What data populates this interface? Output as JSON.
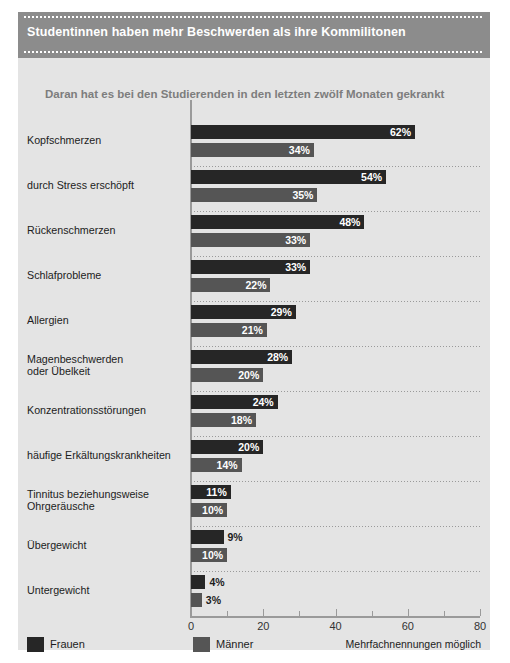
{
  "header": {
    "title": "Studentinnen haben mehr Beschwerden als ihre Kommilitonen",
    "band_color": "#8c8c8c",
    "title_color": "#ffffff"
  },
  "subtitle": "Daran hat es bei den Studierenden in den letzten zwölf Monaten gekrankt",
  "legend": {
    "series_1_label": "Frauen",
    "series_1_color": "#262626",
    "series_2_label": "Männer",
    "series_2_color": "#555555",
    "note": "Mehrfachnennungen möglich"
  },
  "axis": {
    "ticks": [
      "0",
      "20",
      "40",
      "60",
      "80"
    ],
    "minor_ticks": [
      10,
      30,
      50,
      70
    ]
  },
  "values_display": {
    "kopfschmerzen": {
      "frauen": "62%",
      "maenner": "34%"
    },
    "stress": {
      "frauen": "54%",
      "maenner": "35%"
    },
    "ruecken": {
      "frauen": "48%",
      "maenner": "33%"
    },
    "schlaf": {
      "frauen": "33%",
      "maenner": "22%"
    },
    "allergien": {
      "frauen": "29%",
      "maenner": "21%"
    },
    "magen": {
      "frauen": "28%",
      "maenner": "20%"
    },
    "konzentration": {
      "frauen": "24%",
      "maenner": "18%"
    },
    "erkaeltung": {
      "frauen": "20%",
      "maenner": "14%"
    },
    "tinnitus": {
      "frauen": "11%",
      "maenner": "10%"
    },
    "uebergewicht": {
      "frauen": "9%",
      "maenner": "10%"
    },
    "untergewicht": {
      "frauen": "4%",
      "maenner": "3%"
    }
  },
  "chart_data": {
    "type": "bar",
    "orientation": "horizontal",
    "title": "Studentinnen haben mehr Beschwerden als ihre Kommilitonen",
    "subtitle": "Daran hat es bei den Studierenden in den letzten zwölf Monaten gekrankt",
    "xlabel": "",
    "ylabel": "",
    "xlim": [
      0,
      80
    ],
    "xticks": [
      0,
      20,
      40,
      60,
      80
    ],
    "grid": false,
    "legend_position": "bottom-left",
    "annotation": "Mehrfachnennungen möglich",
    "categories": [
      "Kopfschmerzen",
      "durch Stress erschöpft",
      "Rückenschmerzen",
      "Schlafprobleme",
      "Allergien",
      "Magenbeschwerden oder Übelkeit",
      "Konzentrationsstörungen",
      "häufige Erkältungskrankheiten",
      "Tinnitus beziehungsweise Ohrgeräusche",
      "Übergewicht",
      "Untergewicht"
    ],
    "category_lines": [
      [
        "Kopfschmerzen"
      ],
      [
        "durch Stress erschöpft"
      ],
      [
        "Rückenschmerzen"
      ],
      [
        "Schlafprobleme"
      ],
      [
        "Allergien"
      ],
      [
        "Magenbeschwerden",
        "oder Übelkeit"
      ],
      [
        "Konzentrationsstörungen"
      ],
      [
        "häufige Erkältungskrankheiten"
      ],
      [
        "Tinnitus beziehungsweise",
        "Ohrgeräusche"
      ],
      [
        "Übergewicht"
      ],
      [
        "Untergewicht"
      ]
    ],
    "series": [
      {
        "name": "Frauen",
        "color": "#262626",
        "values": [
          62,
          54,
          48,
          33,
          29,
          28,
          24,
          20,
          11,
          9,
          4
        ]
      },
      {
        "name": "Männer",
        "color": "#555555",
        "values": [
          34,
          35,
          33,
          22,
          21,
          20,
          18,
          14,
          10,
          10,
          3
        ]
      }
    ],
    "value_labels": [
      [
        "62%",
        "54%",
        "48%",
        "33%",
        "29%",
        "28%",
        "24%",
        "20%",
        "11%",
        "9%",
        "4%"
      ],
      [
        "34%",
        "35%",
        "33%",
        "22%",
        "21%",
        "20%",
        "18%",
        "14%",
        "10%",
        "10%",
        "3%"
      ]
    ],
    "unit": "%"
  }
}
